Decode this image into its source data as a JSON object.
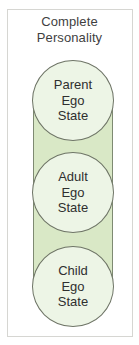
{
  "diagram": {
    "title_lines": [
      "Complete",
      "Personality"
    ],
    "colors": {
      "band_fill": "#d9e8c6",
      "circle_fill": "#edf5e6",
      "outline": "#6e7466",
      "frame_border": "#d6d6d2",
      "text": "#2f2f2f"
    },
    "ego_states": [
      {
        "lines": [
          "Parent",
          "Ego",
          "State"
        ]
      },
      {
        "lines": [
          "Adult",
          "Ego",
          "State"
        ]
      },
      {
        "lines": [
          "Child",
          "Ego",
          "State"
        ]
      }
    ]
  }
}
